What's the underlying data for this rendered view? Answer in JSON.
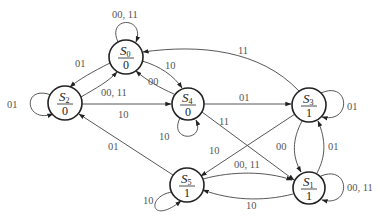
{
  "diagram": {
    "type": "state-diagram",
    "states": [
      {
        "id": "S0",
        "name": "S",
        "sub": "0",
        "output": "0"
      },
      {
        "id": "S1",
        "name": "S",
        "sub": "1",
        "output": "1"
      },
      {
        "id": "S2",
        "name": "S",
        "sub": "2",
        "output": "0"
      },
      {
        "id": "S3",
        "name": "S",
        "sub": "3",
        "output": "1"
      },
      {
        "id": "S4",
        "name": "S",
        "sub": "4",
        "output": "0"
      },
      {
        "id": "S5",
        "name": "S",
        "sub": "5",
        "output": "1"
      }
    ],
    "transitions": [
      {
        "from": "S0",
        "to": "S0",
        "label": "00, 11"
      },
      {
        "from": "S0",
        "to": "S2",
        "label": "01"
      },
      {
        "from": "S0",
        "to": "S4",
        "label": "10"
      },
      {
        "from": "S2",
        "to": "S2",
        "label": "01"
      },
      {
        "from": "S2",
        "to": "S0",
        "label": "00, 11"
      },
      {
        "from": "S2",
        "to": "S4",
        "label": "10"
      },
      {
        "from": "S4",
        "to": "S0",
        "label": "00"
      },
      {
        "from": "S4",
        "to": "S4",
        "label": "10"
      },
      {
        "from": "S4",
        "to": "S3",
        "label": "01"
      },
      {
        "from": "S4",
        "to": "S1",
        "label": "11"
      },
      {
        "from": "S3",
        "to": "S0",
        "label": "11"
      },
      {
        "from": "S3",
        "to": "S3",
        "label": "01"
      },
      {
        "from": "S3",
        "to": "S1",
        "label": "00"
      },
      {
        "from": "S3",
        "to": "S5",
        "label": "10"
      },
      {
        "from": "S1",
        "to": "S3",
        "label": "01"
      },
      {
        "from": "S1",
        "to": "S1",
        "label": "00, 11"
      },
      {
        "from": "S1",
        "to": "S5",
        "label": "10"
      },
      {
        "from": "S5",
        "to": "S5",
        "label": "10"
      },
      {
        "from": "S5",
        "to": "S1",
        "label": "00, 11"
      },
      {
        "from": "S5",
        "to": "S2",
        "label": "01"
      }
    ]
  }
}
